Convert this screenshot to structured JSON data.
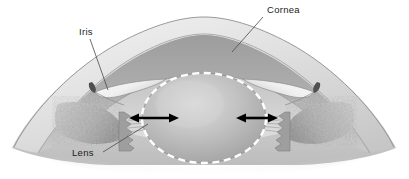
{
  "figure": {
    "name": "anterior-eye-cross-section",
    "background_color": "#ffffff",
    "width": 409,
    "height": 179
  },
  "labels": [
    {
      "id": "cornea",
      "text": "Cornea",
      "text_x": 267,
      "text_y": 13,
      "leader": "M 263,17 L 232,52"
    },
    {
      "id": "iris",
      "text": "Iris",
      "text_x": 79,
      "text_y": 35,
      "leader": "M 90,39 L 108,90"
    },
    {
      "id": "lens",
      "text": "Lens",
      "text_x": 72,
      "text_y": 156,
      "leader": "M 103,152 L 148,124"
    }
  ],
  "annotations": {
    "arrows": [
      {
        "id": "left-accommodation-arrow",
        "name": "left-double-headed-arrow",
        "x1": 130,
        "x2": 178,
        "y": 118,
        "color": "#000000"
      },
      {
        "id": "right-accommodation-arrow",
        "name": "right-double-headed-arrow",
        "x1": 237,
        "x2": 277,
        "y": 118,
        "color": "#000000"
      }
    ]
  },
  "structures": {
    "sclera": {
      "name": "sclera",
      "fill": "#d7d7d7"
    },
    "cornea_outer": {
      "name": "cornea-outer-layer",
      "fill": "#e6e6e6"
    },
    "cornea_inner": {
      "name": "cornea-inner-stroma",
      "fill": "#a8a8a8"
    },
    "anterior_chamber": {
      "name": "anterior-chamber",
      "fill": "#cfcfcf"
    },
    "iris_left": {
      "name": "iris-left-leaflet",
      "fill": "#f4f4f4"
    },
    "iris_right": {
      "name": "iris-right-leaflet",
      "fill": "#f4f4f4"
    },
    "ciliary_body_left": {
      "name": "ciliary-body-left",
      "fill": "#b5b5b5"
    },
    "ciliary_body_right": {
      "name": "ciliary-body-right",
      "fill": "#b5b5b5"
    },
    "lens": {
      "name": "crystalline-lens",
      "fill": "#b9b9b9"
    },
    "lens_capsule": {
      "name": "lens-capsule-dashed",
      "stroke": "#ffffff"
    },
    "zonules": {
      "name": "zonular-fibers",
      "stroke": "#9a9a9a"
    }
  },
  "colors": {
    "ink": "#1c1c1c",
    "leader": "#4a4a4a",
    "arrow": "#000000",
    "capsule_white": "#ffffff",
    "background": "#ffffff"
  }
}
